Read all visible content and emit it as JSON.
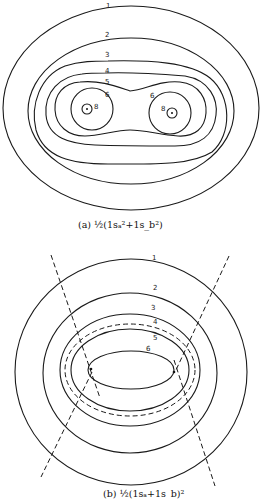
{
  "figure": {
    "panel_a": {
      "caption_prefix": "(a)",
      "caption_formula": "½(1sₐ²+1s_b²)",
      "contour_labels": [
        "1",
        "2",
        "3",
        "4",
        "5",
        "6",
        "6",
        "8",
        "8"
      ]
    },
    "panel_b": {
      "caption_prefix": "(b)",
      "caption_formula": "½(1sₐ+1s_b)²",
      "contour_labels": [
        "1",
        "2",
        "3",
        "4",
        "5",
        "6"
      ],
      "dashed_lines": 2,
      "dashed_contour": "4"
    }
  },
  "labels": {
    "a1": "1",
    "a2": "2",
    "a3": "3",
    "a4": "4",
    "a5": "5",
    "a6l": "6",
    "a6r": "6",
    "a8l": "8",
    "a8r": "8",
    "b1": "1",
    "b2": "2",
    "b3": "3",
    "b4": "4",
    "b5": "5",
    "b6": "6"
  }
}
